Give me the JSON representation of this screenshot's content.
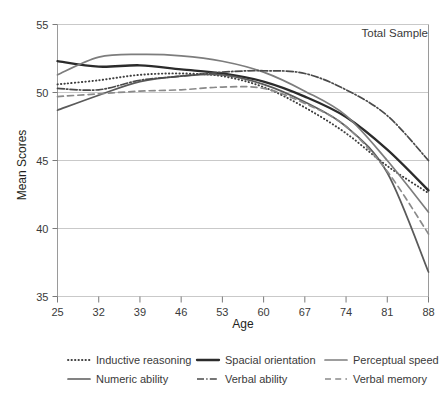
{
  "annotation": {
    "total_sample_label": "Total Sample"
  },
  "axes": {
    "x_title": "Age",
    "y_title": "Mean Scores",
    "x_ticks": [
      "25",
      "32",
      "39",
      "46",
      "53",
      "60",
      "67",
      "74",
      "81",
      "88"
    ],
    "y_ticks": [
      "55",
      "50",
      "45",
      "40",
      "35"
    ]
  },
  "legend": {
    "items": [
      {
        "label": "Inductive reasoning",
        "style": "dotted",
        "color": "#3f3f3f"
      },
      {
        "label": "Spacial orientation",
        "style": "solid-thick",
        "color": "#2b2b2b"
      },
      {
        "label": "Perceptual speed",
        "style": "solid",
        "color": "#7d7d7d"
      },
      {
        "label": "Numeric ability",
        "style": "solid",
        "color": "#5a5a5a"
      },
      {
        "label": "Verbal ability",
        "style": "dash-dot",
        "color": "#4a4a4a"
      },
      {
        "label": "Verbal memory",
        "style": "dashed",
        "color": "#8a8a8a"
      }
    ]
  },
  "chart_data": {
    "type": "line",
    "title": "Total Sample",
    "xlabel": "Age",
    "ylabel": "Mean Scores",
    "xlim": [
      25,
      88
    ],
    "ylim": [
      35,
      55
    ],
    "xticks": [
      25,
      32,
      39,
      46,
      53,
      60,
      67,
      74,
      81,
      88
    ],
    "yticks": [
      35,
      40,
      45,
      50,
      55
    ],
    "grid": true,
    "legend_position": "below",
    "x": [
      25,
      32,
      39,
      46,
      53,
      60,
      67,
      74,
      81,
      88
    ],
    "series": [
      {
        "name": "Inductive reasoning",
        "style": "dotted",
        "color": "#3f3f3f",
        "values": [
          50.6,
          50.9,
          51.3,
          51.4,
          51.2,
          50.4,
          48.9,
          47.0,
          44.6,
          42.6
        ]
      },
      {
        "name": "Spacial orientation",
        "style": "solid-thick",
        "color": "#2b2b2b",
        "values": [
          52.3,
          51.9,
          52.0,
          51.7,
          51.4,
          50.8,
          49.7,
          48.2,
          45.8,
          42.8
        ]
      },
      {
        "name": "Perceptual speed",
        "style": "solid",
        "color": "#7d7d7d",
        "values": [
          51.3,
          52.6,
          52.8,
          52.7,
          52.3,
          51.5,
          50.1,
          48.3,
          45.0,
          41.2
        ]
      },
      {
        "name": "Numeric ability",
        "style": "solid",
        "color": "#5a5a5a",
        "values": [
          48.7,
          49.8,
          50.8,
          51.2,
          51.3,
          50.6,
          49.3,
          47.5,
          44.1,
          36.8
        ]
      },
      {
        "name": "Verbal ability",
        "style": "dash-dot",
        "color": "#4a4a4a",
        "values": [
          50.3,
          50.2,
          50.9,
          51.2,
          51.5,
          51.6,
          51.4,
          50.2,
          48.3,
          45.0
        ]
      },
      {
        "name": "Verbal memory",
        "style": "dashed",
        "color": "#8a8a8a",
        "values": [
          49.7,
          49.9,
          50.1,
          50.2,
          50.4,
          50.3,
          49.2,
          47.5,
          44.2,
          39.6
        ]
      }
    ]
  }
}
